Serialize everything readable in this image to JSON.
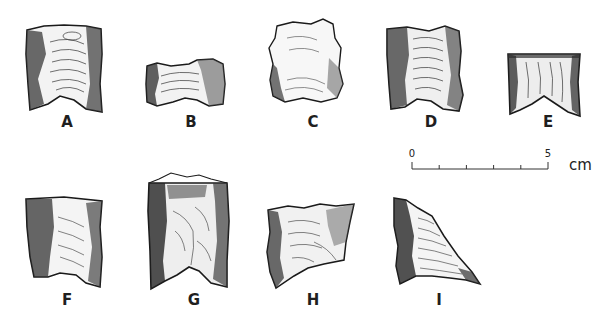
{
  "figure": {
    "artifacts": [
      {
        "id": "A",
        "label": "A"
      },
      {
        "id": "B",
        "label": "B"
      },
      {
        "id": "C",
        "label": "C"
      },
      {
        "id": "D",
        "label": "D"
      },
      {
        "id": "E",
        "label": "E"
      },
      {
        "id": "F",
        "label": "F"
      },
      {
        "id": "G",
        "label": "G"
      },
      {
        "id": "H",
        "label": "H"
      },
      {
        "id": "I",
        "label": "I"
      }
    ],
    "scale_bar": {
      "start_label": "0",
      "end_label": "5",
      "unit": "cm",
      "divisions": 5
    },
    "colors": {
      "ink": "#1a1a1a",
      "background": "#ffffff"
    }
  }
}
